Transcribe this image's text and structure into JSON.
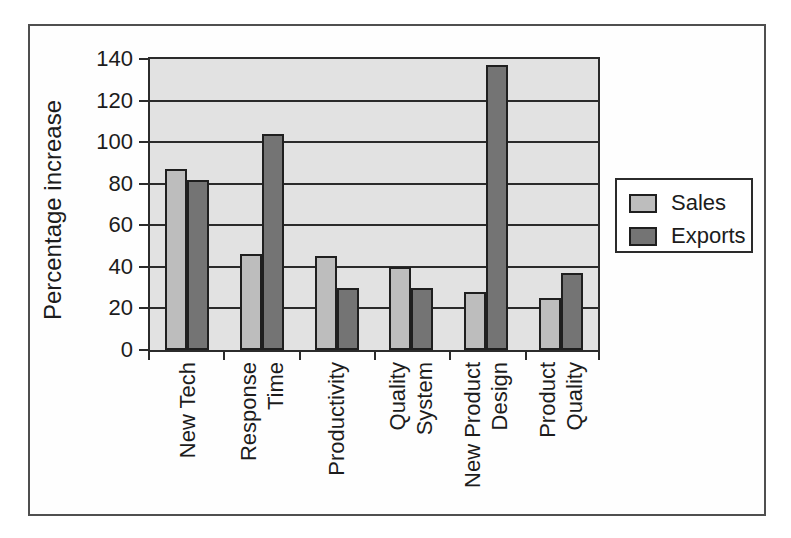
{
  "figure": {
    "background": "#ffffff",
    "frame_border_color": "#4f4f4f"
  },
  "colors": {
    "plot_background": "#e2e2e2",
    "grid_line": "#2b2b2b",
    "bar_outline": "#1f1f1f",
    "text": "#1c1c1c",
    "sales_fill": "#bdbdbd",
    "exports_fill": "#747474"
  },
  "chart_data": {
    "type": "bar",
    "title": "",
    "xlabel": "",
    "ylabel": "Percentage increase",
    "categories": [
      "New Tech",
      "Response Time",
      "Productivity",
      "Quality System",
      "New Product Design",
      "Product Quality"
    ],
    "category_label_lines": [
      [
        "New Tech"
      ],
      [
        "Response",
        "Time"
      ],
      [
        "Productivity"
      ],
      [
        "Quality",
        "System"
      ],
      [
        "New Product",
        "Design"
      ],
      [
        "Product",
        "Quality"
      ]
    ],
    "series": [
      {
        "name": "Sales",
        "color": "#bdbdbd",
        "values": [
          87,
          46,
          45,
          40,
          28,
          25
        ]
      },
      {
        "name": "Exports",
        "color": "#747474",
        "values": [
          82,
          104,
          30,
          30,
          137,
          37
        ]
      }
    ],
    "ylim": [
      0,
      140
    ],
    "yticks": [
      0,
      20,
      40,
      60,
      80,
      100,
      120,
      140
    ],
    "grid": true,
    "gridlines": "horizontal",
    "legend_position": "right",
    "legend_labels": [
      "Sales",
      "Exports"
    ]
  }
}
